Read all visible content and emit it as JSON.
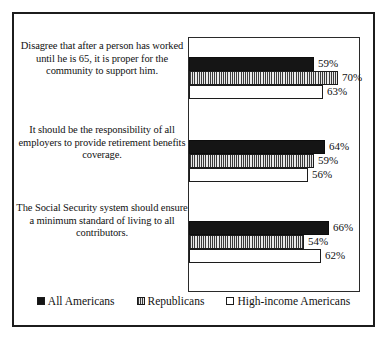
{
  "chart_data": {
    "type": "bar",
    "orientation": "horizontal",
    "title": "",
    "subtitle": "",
    "xlabel": "",
    "ylabel": "",
    "xlim": [
      0,
      80
    ],
    "grid": false,
    "legend_position": "bottom",
    "value_suffix": "%",
    "categories": [
      "Disagree that after a person has worked until he is 65, it is proper for the community to support him.",
      "It should be the responsibility of all employers to provide retirement benefits coverage.",
      "The Social Security system should ensure a minimum standard of living to all contributors."
    ],
    "series": [
      {
        "name": "All Americans",
        "style": "solid-black",
        "color": "#151515",
        "values": [
          59,
          64,
          66
        ]
      },
      {
        "name": "Republicans",
        "style": "vertical-stripe",
        "color": "#c9c9c9",
        "values": [
          70,
          59,
          54
        ]
      },
      {
        "name": "High-income Americans",
        "style": "white",
        "color": "#ffffff",
        "values": [
          63,
          56,
          62
        ]
      }
    ],
    "data_labels": [
      [
        "59%",
        "70%",
        "63%"
      ],
      [
        "64%",
        "59%",
        "56%"
      ],
      [
        "66%",
        "54%",
        "62%"
      ]
    ]
  },
  "legend": {
    "items": [
      {
        "label": "All Americans"
      },
      {
        "label": "Republicans"
      },
      {
        "label": "High-income Americans"
      }
    ]
  },
  "colors": {
    "frame": "#1c1c1c",
    "plot_border": "#2a2a2a",
    "text": "#111111",
    "background": "#ffffff",
    "series_all_americans": "#151515",
    "series_republicans": "#c9c9c9",
    "series_high_income": "#ffffff"
  }
}
